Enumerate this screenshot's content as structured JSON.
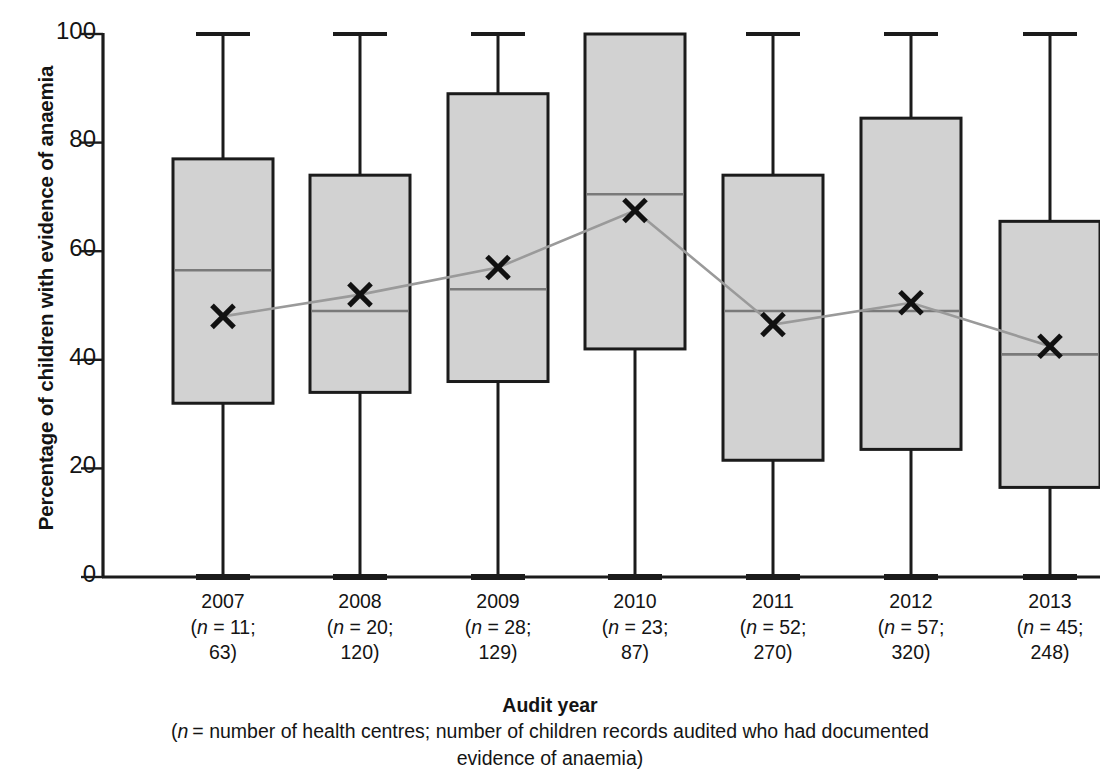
{
  "chart_data": {
    "type": "box",
    "title": "",
    "xlabel": "Audit year",
    "xlabel_note": "(n = number of health centres; number of children records audited who had documented evidence of anaemia)",
    "ylabel": "Percentage of children with evidence of anaemia",
    "ylim": [
      0,
      100
    ],
    "yticks": [
      0,
      20,
      40,
      60,
      80,
      100
    ],
    "ytick_labels": [
      "0",
      "20",
      "40",
      "60",
      "80",
      "100"
    ],
    "grid": false,
    "legend": "none",
    "box_fill": "#d2d2d2",
    "box_stroke": "#1b1b1b",
    "median_color": "#7a7a7a",
    "mean_line_color": "#9a9a9a",
    "mean_marker": "x",
    "categories": [
      "2007",
      "2008",
      "2009",
      "2010",
      "2011",
      "2012",
      "2013"
    ],
    "category_sublabels": [
      {
        "line1": "(n = 11;",
        "line2": "63)"
      },
      {
        "line1": "(n = 20;",
        "line2": "120)"
      },
      {
        "line1": "(n = 28;",
        "line2": "129)"
      },
      {
        "line1": "(n = 23;",
        "line2": "87)"
      },
      {
        "line1": "(n = 52;",
        "line2": "270)"
      },
      {
        "line1": "(n = 57;",
        "line2": "320)"
      },
      {
        "line1": "(n = 45;",
        "line2": "248)"
      }
    ],
    "n_health_centres": [
      11,
      20,
      28,
      23,
      52,
      57,
      45
    ],
    "n_records_audited": [
      63,
      120,
      129,
      87,
      270,
      320,
      248
    ],
    "boxes": [
      {
        "category": "2007",
        "whisker_low": 0,
        "q1": 32,
        "median": 56.5,
        "q3": 77,
        "whisker_high": 100,
        "mean": 48
      },
      {
        "category": "2008",
        "whisker_low": 0,
        "q1": 34,
        "median": 49,
        "q3": 74,
        "whisker_high": 100,
        "mean": 52
      },
      {
        "category": "2009",
        "whisker_low": 0,
        "q1": 36,
        "median": 53,
        "q3": 89,
        "whisker_high": 100,
        "mean": 57
      },
      {
        "category": "2010",
        "whisker_low": 0,
        "q1": 42,
        "median": 70.5,
        "q3": 100,
        "whisker_high": 100,
        "mean": 67.5
      },
      {
        "category": "2011",
        "whisker_low": 0,
        "q1": 21.5,
        "median": 49,
        "q3": 74,
        "whisker_high": 100,
        "mean": 46.5
      },
      {
        "category": "2012",
        "whisker_low": 0,
        "q1": 23.5,
        "median": 49,
        "q3": 84.5,
        "whisker_high": 100,
        "mean": 50.5
      },
      {
        "category": "2013",
        "whisker_low": 0,
        "q1": 16.5,
        "median": 41,
        "q3": 65.5,
        "whisker_high": 100,
        "mean": 42.5
      }
    ],
    "mean_series": {
      "name": "Mean",
      "values": [
        48,
        52,
        57,
        67.5,
        46.5,
        50.5,
        42.5
      ]
    }
  }
}
